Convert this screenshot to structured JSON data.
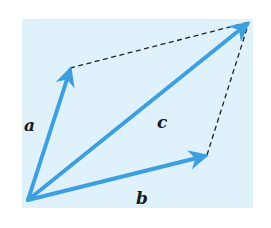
{
  "diagram": {
    "background_color": "#dff1fb",
    "vector_color": "#3d9fe0",
    "dash_color": "#222222",
    "origin": [
      28,
      200
    ],
    "vectors": [
      {
        "name": "a",
        "label": "a",
        "tip": [
          70,
          68
        ],
        "label_pos": [
          22,
          128
        ]
      },
      {
        "name": "b",
        "label": "b",
        "tip": [
          207,
          155
        ],
        "label_pos": [
          137,
          199
        ]
      },
      {
        "name": "c",
        "label": "c",
        "tip": [
          249,
          22
        ],
        "label_pos": [
          158,
          127
        ]
      }
    ],
    "dashed_edges": [
      {
        "from": [
          70,
          68
        ],
        "to": [
          249,
          22
        ]
      },
      {
        "from": [
          207,
          155
        ],
        "to": [
          249,
          22
        ]
      }
    ]
  }
}
